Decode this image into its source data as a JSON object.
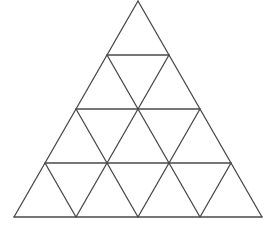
{
  "diagram": {
    "type": "subdivided-equilateral-triangle",
    "subdivisions_per_side": 4,
    "small_triangles": 16,
    "stroke_color": "#4a4a4a",
    "background": "#ffffff",
    "apex": [
      138,
      1
    ],
    "bottom_left": [
      14,
      217
    ],
    "bottom_right": [
      262,
      217
    ],
    "row_y": [
      1,
      55,
      109,
      163,
      217
    ]
  }
}
